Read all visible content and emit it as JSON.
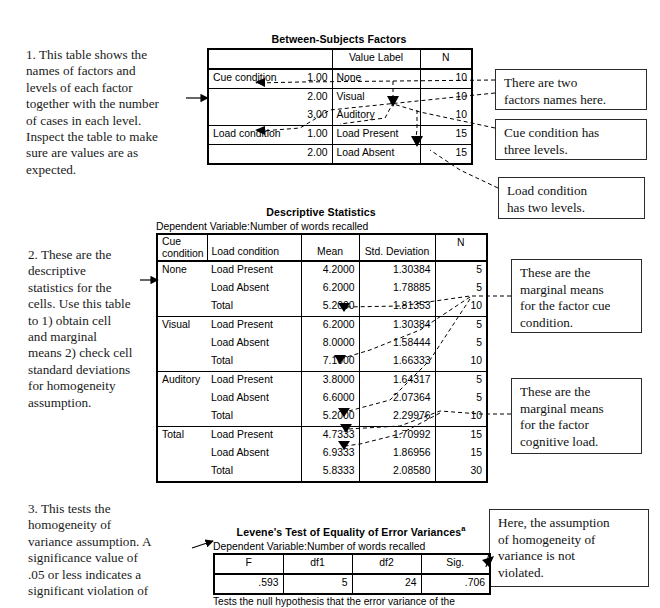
{
  "notes": {
    "note1": "1. This table shows the\nnames of factors and\nlevels of each factor\ntogether with the number\nof cases in each level.\nInspect the table to make\nsure are values are as\nexpected.",
    "note2": "2. These are the\ndescriptive\nstatistics for the\ncells. Use this table\nto 1) obtain cell\nand marginal\nmeans 2) check cell\nstandard deviations\nfor homogeneity\nassumption.",
    "note3": "3. This tests the\nhomogeneity of\nvariance assumption. A\nsignificance value of\n.05 or less indicates a\nsignificant violation of"
  },
  "callouts": {
    "two_factor_names": "There are two\nfactors names here.",
    "cue_three_levels": "Cue condition has\nthree levels.",
    "load_two_levels": "Load condition\nhas two levels.",
    "marginal_cue": "These are the\nmarginal means\nfor the factor cue\ncondition.",
    "marginal_load": "These are the\nmarginal means\nfor the factor\ncognitive load.",
    "assumption_ok": "Here, the assumption\nof homogeneity of\nvariance is not\nviolated."
  },
  "between_subjects": {
    "title": "Between-Subjects Factors",
    "headers": [
      "",
      "",
      "Value Label",
      "N"
    ],
    "rows": [
      {
        "factor": "Cue condition",
        "value": "1.00",
        "label": "None",
        "n": "10"
      },
      {
        "factor": "",
        "value": "2.00",
        "label": "Visual",
        "n": "10"
      },
      {
        "factor": "",
        "value": "3.00",
        "label": "Auditory",
        "n": "10"
      },
      {
        "factor": "Load condition",
        "value": "1.00",
        "label": "Load Present",
        "n": "15"
      },
      {
        "factor": "",
        "value": "2.00",
        "label": "Load Absent",
        "n": "15"
      }
    ]
  },
  "descriptives": {
    "title": "Descriptive Statistics",
    "subtitle": "Dependent Variable:Number of words recalled",
    "headers": [
      "Cue\ncondition",
      "Load condition",
      "Mean",
      "Std. Deviation",
      "N"
    ],
    "headers_flat": {
      "cue": "Cue\ncondition",
      "load": "Load condition",
      "mean": "Mean",
      "sd": "Std. Deviation",
      "n": "N"
    },
    "rows": [
      {
        "cue": "None",
        "load": "Load Present",
        "mean": "4.2000",
        "sd": "1.30384",
        "n": "5"
      },
      {
        "cue": "",
        "load": "Load Absent",
        "mean": "6.2000",
        "sd": "1.78885",
        "n": "5"
      },
      {
        "cue": "",
        "load": "Total",
        "mean": "5.2000",
        "sd": "1.81353",
        "n": "10"
      },
      {
        "cue": "Visual",
        "load": "Load Present",
        "mean": "6.2000",
        "sd": "1.30384",
        "n": "5"
      },
      {
        "cue": "",
        "load": "Load Absent",
        "mean": "8.0000",
        "sd": "1.58444",
        "n": "5"
      },
      {
        "cue": "",
        "load": "Total",
        "mean": "7.1000",
        "sd": "1.66333",
        "n": "10"
      },
      {
        "cue": "Auditory",
        "load": "Load Present",
        "mean": "3.8000",
        "sd": "1.64317",
        "n": "5"
      },
      {
        "cue": "",
        "load": "Load Absent",
        "mean": "6.6000",
        "sd": "2.07364",
        "n": "5"
      },
      {
        "cue": "",
        "load": "Total",
        "mean": "5.2000",
        "sd": "2.29976",
        "n": "10"
      },
      {
        "cue": "Total",
        "load": "Load Present",
        "mean": "4.7333",
        "sd": "1.70992",
        "n": "15"
      },
      {
        "cue": "",
        "load": "Load Absent",
        "mean": "6.9333",
        "sd": "1.86956",
        "n": "15"
      },
      {
        "cue": "",
        "load": "Total",
        "mean": "5.8333",
        "sd": "2.08580",
        "n": "30"
      }
    ]
  },
  "levene": {
    "title": "Levene's Test of Equality of Error Variances",
    "title_superscript": "a",
    "subtitle": "Dependent Variable:Number of words recalled",
    "headers": [
      "F",
      "df1",
      "df2",
      "Sig."
    ],
    "row": {
      "f": ".593",
      "df1": "5",
      "df2": "24",
      "sig": ".706"
    },
    "footnote": "Tests the null hypothesis that the error variance of the"
  }
}
